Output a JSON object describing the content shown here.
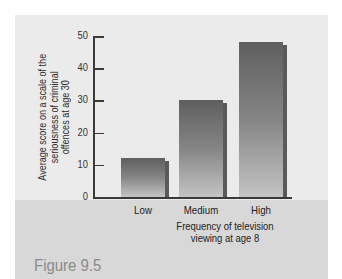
{
  "figure_label": "Figure 9.5",
  "chart_data": {
    "type": "bar",
    "title": "",
    "categories": [
      "Low",
      "Medium",
      "High"
    ],
    "values": [
      12,
      30,
      48
    ],
    "xlabel": "Frequency of television viewing at age 8",
    "xlabel_lines": [
      "Frequency of television",
      "viewing at age 8"
    ],
    "ylabel": "Average score on a scale of the seriousness of criminal offences at age 30",
    "ylabel_lines": [
      "Average score on a scale of the",
      "seriousness of criminal",
      "offences at age 30"
    ],
    "ylim": [
      0,
      50
    ],
    "yticks": [
      0,
      10,
      20,
      30,
      40,
      50
    ],
    "grid": false,
    "legend": null
  },
  "colors": {
    "panel_upper": "#ebebeb",
    "panel_lower": "#d8d8d8",
    "bar_top": "#5f5f5f",
    "bar_bottom": "#c4c4c4",
    "caption": "#8a8a8a"
  }
}
